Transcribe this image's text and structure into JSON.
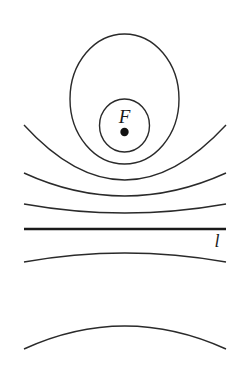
{
  "diagram": {
    "type": "conic-sections-family",
    "colors": {
      "background": "#ffffff",
      "stroke": "#2a2a2a",
      "directrix": "#1a1a1a"
    },
    "focus": {
      "label": "F",
      "x": 124.5,
      "y": 132
    },
    "directrix": {
      "label": "l",
      "y": 229,
      "x1": 24,
      "x2": 226
    },
    "ellipses": [
      {
        "name": "outer-ellipse",
        "cx": 124.5,
        "cy": 99,
        "rx": 54.5,
        "ry": 65
      },
      {
        "name": "inner-ellipse",
        "cx": 124.5,
        "cy": 125.5,
        "rx": 25,
        "ry": 26.5
      }
    ],
    "curves_above_directrix": [
      {
        "name": "curve-1",
        "path": "M24,125 Q124.5,235 226,125"
      },
      {
        "name": "curve-2",
        "path": "M24,173 Q124.5,219 226,173"
      },
      {
        "name": "curve-3",
        "path": "M24,204 Q124.5,222 226,204"
      }
    ],
    "curves_below_directrix": [
      {
        "name": "curve-4",
        "path": "M24,262 Q124.5,244 226,262"
      },
      {
        "name": "curve-5",
        "path": "M24,349 Q124.5,303 226,349"
      }
    ]
  }
}
